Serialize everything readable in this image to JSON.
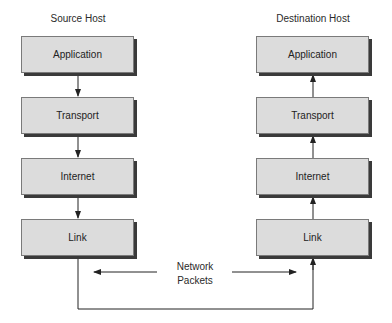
{
  "diagram": {
    "source_host": {
      "title": "Source Host",
      "layers": [
        "Application",
        "Transport",
        "Internet",
        "Link"
      ],
      "flow": "down"
    },
    "destination_host": {
      "title": "Destination Host",
      "layers": [
        "Application",
        "Transport",
        "Internet",
        "Link"
      ],
      "flow": "up"
    },
    "network": {
      "label_line1": "Network",
      "label_line2": "Packets"
    }
  }
}
